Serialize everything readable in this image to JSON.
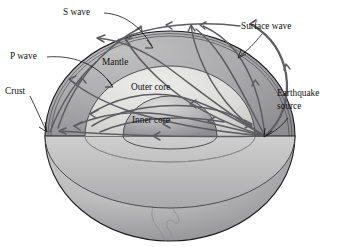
{
  "figure": {
    "background_color": "#ffffff"
  },
  "labels": {
    "s_wave": "S wave",
    "p_wave": "P wave",
    "surface_wave": "Surface wave",
    "crust": "Crust",
    "mantle": "Mantle",
    "outer_core": "Outer core",
    "inner_core": "Inner core",
    "earthquake_source_line1": "Earthquake",
    "earthquake_source_line2": "source"
  },
  "colors": {
    "mantle_fill": "#a8a8aa",
    "outer_core_fill": "#d7d7d6",
    "inner_core_fill": "#b0b0b2",
    "lower_hemisphere_fill": "#b5b5b6",
    "ray_stroke": "#5d5d61",
    "boundary_stroke": "#3a3a3e",
    "outline_stroke": "#1d1d20",
    "text_color": "#111111"
  },
  "geometry": {
    "sphere_center_x": 170,
    "sphere_center_y": 136,
    "sphere_radius_x": 125,
    "sphere_radius_y": 105,
    "equator_y": 136,
    "source_x": 265,
    "source_y": 136
  }
}
